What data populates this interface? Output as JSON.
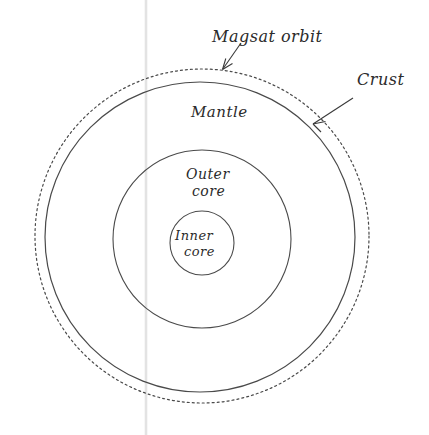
{
  "diagram": {
    "background_color": "#ffffff",
    "line_color": "#4a4a4a",
    "text_color": "#2b2b2b",
    "guide_line_color": "#e3e3e3",
    "labels": {
      "magsat_orbit": "Magsat orbit",
      "crust": "Crust",
      "mantle": "Mantle",
      "outer_core_line1": "Outer",
      "outer_core_line2": "core",
      "inner_core_line1": "Inner",
      "inner_core_line2": "core"
    },
    "geometry": {
      "magsat_orbit_circle": {
        "cx": 202,
        "cy": 236,
        "r": 167,
        "style": "dotted"
      },
      "crust_circle": {
        "cx": 200,
        "cy": 237,
        "r": 155,
        "style": "solid"
      },
      "outer_core_circle": {
        "cx": 202,
        "cy": 239,
        "r": 89,
        "style": "solid"
      },
      "inner_core_circle": {
        "cx": 202,
        "cy": 243,
        "r": 32,
        "style": "solid"
      },
      "vertical_guide_line_x": 146
    }
  }
}
